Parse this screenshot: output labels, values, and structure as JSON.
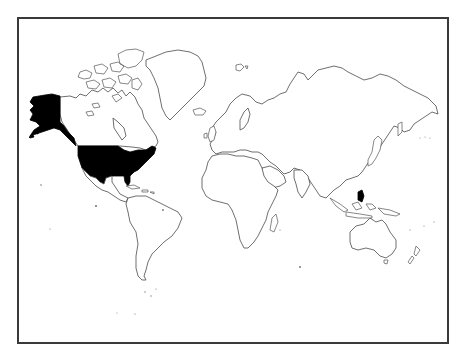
{
  "map": {
    "projection": "Mercator",
    "style": "outline world map",
    "frame_color": "#3a3a3a",
    "land_fill": "#ffffff",
    "coastline_color": "#4a4a4a",
    "highlight_color": "#000000",
    "highlighted_regions": [
      {
        "name": "United States (contiguous)",
        "fill": "#000000"
      },
      {
        "name": "Alaska",
        "fill": "#000000"
      }
    ],
    "regions": [
      "North America",
      "Canada",
      "Greenland",
      "Central America",
      "South America",
      "Europe",
      "Africa",
      "Asia",
      "Australia",
      "New Zealand"
    ],
    "labels": []
  }
}
